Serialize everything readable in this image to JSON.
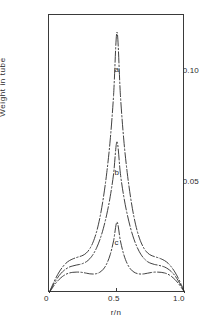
{
  "chart_data": {
    "type": "line",
    "title": "",
    "subtitle": "",
    "xlabel": "r/n",
    "ylabel": "Weight in tube",
    "xlim": [
      0,
      1.0
    ],
    "ylim": [
      0,
      0.1305
    ],
    "grid": false,
    "legend_position": "inline-curve-labels",
    "xticks": [
      {
        "value": 0,
        "label": "0"
      },
      {
        "value": 0.5,
        "label": "0.5"
      },
      {
        "value": 1.0,
        "label": "1.0"
      }
    ],
    "yticks": [
      {
        "value": 0.05,
        "label": "0.05"
      },
      {
        "value": 0.1,
        "label": "0.10"
      }
    ],
    "annotations": [
      {
        "text": "a",
        "x": 0.5,
        "y": 0.1045
      },
      {
        "text": "b",
        "x": 0.5,
        "y": 0.0565
      },
      {
        "text": "c",
        "x": 0.5,
        "y": 0.0235
      }
    ],
    "x": [
      0.0,
      0.025,
      0.05,
      0.075,
      0.1,
      0.125,
      0.15,
      0.175,
      0.2,
      0.225,
      0.25,
      0.275,
      0.3,
      0.325,
      0.35,
      0.375,
      0.4,
      0.425,
      0.45,
      0.475,
      0.5,
      0.525,
      0.55,
      0.575,
      0.6,
      0.625,
      0.65,
      0.675,
      0.7,
      0.725,
      0.75,
      0.775,
      0.8,
      0.825,
      0.85,
      0.875,
      0.9,
      0.925,
      0.95,
      0.975,
      1.0
    ],
    "series": [
      {
        "name": "a",
        "label": "a",
        "linestyle": "dashdot",
        "color": "#2b2b2b",
        "peak_value": 0.1225,
        "values": [
          0.0,
          0.0036,
          0.007,
          0.0099,
          0.0122,
          0.014,
          0.0152,
          0.016,
          0.0166,
          0.0171,
          0.0177,
          0.0188,
          0.0208,
          0.024,
          0.0288,
          0.0356,
          0.0448,
          0.0566,
          0.0718,
          0.093,
          0.1225,
          0.093,
          0.0718,
          0.0566,
          0.0448,
          0.0356,
          0.0288,
          0.024,
          0.0208,
          0.0188,
          0.0177,
          0.0171,
          0.0166,
          0.016,
          0.0152,
          0.014,
          0.0122,
          0.0099,
          0.007,
          0.0036,
          0.0
        ]
      },
      {
        "name": "b",
        "label": "b",
        "linestyle": "dashdot",
        "color": "#2b2b2b",
        "peak_value": 0.071,
        "values": [
          0.0,
          0.003,
          0.0058,
          0.0082,
          0.01,
          0.0113,
          0.0122,
          0.0127,
          0.0131,
          0.0134,
          0.0139,
          0.0147,
          0.0161,
          0.0182,
          0.0212,
          0.0252,
          0.0304,
          0.037,
          0.0452,
          0.056,
          0.071,
          0.056,
          0.0452,
          0.037,
          0.0304,
          0.0252,
          0.0212,
          0.0182,
          0.0161,
          0.0147,
          0.0139,
          0.0134,
          0.0131,
          0.0127,
          0.0122,
          0.0113,
          0.01,
          0.0082,
          0.0058,
          0.003,
          0.0
        ]
      },
      {
        "name": "c",
        "label": "c",
        "linestyle": "dashdot",
        "color": "#2b2b2b",
        "peak_value": 0.0333,
        "values": [
          0.0,
          0.0024,
          0.0046,
          0.0064,
          0.0078,
          0.0088,
          0.0094,
          0.0097,
          0.0098,
          0.0098,
          0.0096,
          0.0093,
          0.009,
          0.0089,
          0.0091,
          0.0098,
          0.0112,
          0.0138,
          0.018,
          0.0245,
          0.0333,
          0.0245,
          0.018,
          0.0138,
          0.0112,
          0.0098,
          0.0091,
          0.0089,
          0.009,
          0.0093,
          0.0096,
          0.0098,
          0.0098,
          0.0097,
          0.0094,
          0.0088,
          0.0078,
          0.0064,
          0.0046,
          0.0024,
          0.0
        ]
      }
    ]
  }
}
